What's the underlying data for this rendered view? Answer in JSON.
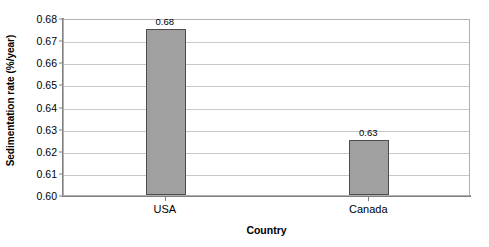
{
  "chart_data": {
    "type": "bar",
    "title": "",
    "categories": [
      "USA",
      "Canada"
    ],
    "values": [
      0.675,
      0.625
    ],
    "data_labels": [
      "0.68",
      "0.63"
    ],
    "xlabel": "Country",
    "ylabel": "Sedimentation rate (%/year)",
    "ylim": [
      0.6,
      0.68
    ],
    "ytick_labels": [
      "0.68",
      "0.67",
      "0.66",
      "0.65",
      "0.64",
      "0.63",
      "0.62",
      "0.61",
      "0.60"
    ],
    "ytick_values": [
      0.68,
      0.67,
      0.66,
      0.65,
      0.64,
      0.63,
      0.62,
      0.61,
      0.6
    ],
    "grid": true,
    "legend": false,
    "bar_fill_color": "#a0a0a0",
    "bar_border_color": "#4d4d4d",
    "gridline_color": "#c8c8c8",
    "plot_border_color": "#b0b0b0",
    "background_color": "#ffffff"
  }
}
